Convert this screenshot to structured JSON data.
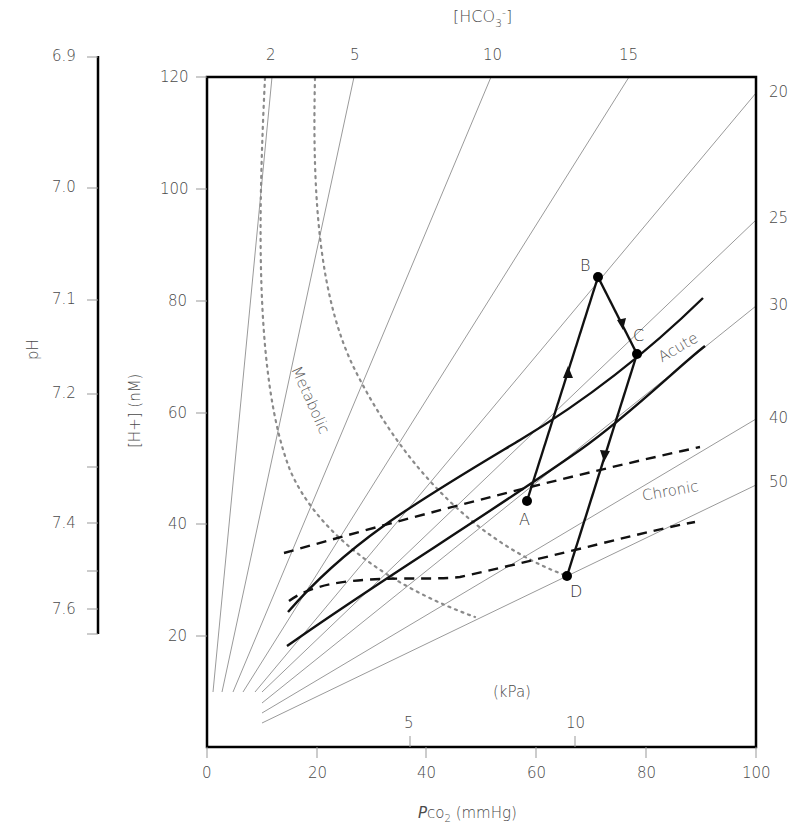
{
  "diagram": {
    "title": "",
    "top_axis": {
      "label": "[HCO3-]",
      "label_main": "[HCO",
      "label_sub": "3",
      "label_sup": "-",
      "label_close": "]",
      "ticks": [
        "2",
        "5",
        "10",
        "15"
      ]
    },
    "right_axis": {
      "ticks": [
        "20",
        "25",
        "30",
        "40",
        "50"
      ]
    },
    "left_ph_axis": {
      "label": "pH",
      "ticks": [
        "6.9",
        "7.0",
        "7.1",
        "7.2",
        "7.4",
        "7.6"
      ]
    },
    "y_axis": {
      "label": "[H+] (nM)",
      "ticks": [
        "120",
        "100",
        "80",
        "60",
        "40",
        "20"
      ]
    },
    "x_axis": {
      "label_italic": "P",
      "label_rest": "co",
      "label_sub": "2",
      "label_unit": " (mmHg)",
      "ticks": [
        "0",
        "20",
        "40",
        "60",
        "80",
        "100"
      ]
    },
    "kpa_axis": {
      "label": "(kPa)",
      "ticks": [
        "5",
        "10"
      ]
    },
    "region_labels": {
      "metabolic": "Metabolic",
      "acute": "Acute",
      "chronic": "Chronic"
    },
    "points": [
      {
        "id": "A",
        "label": "A",
        "pco2": 58,
        "h": 44
      },
      {
        "id": "B",
        "label": "B",
        "pco2": 71,
        "h": 84
      },
      {
        "id": "C",
        "label": "C",
        "pco2": 78,
        "h": 70
      },
      {
        "id": "D",
        "label": "D",
        "pco2": 65,
        "h": 31
      }
    ],
    "path_sequence": [
      "A",
      "B",
      "C",
      "D"
    ],
    "colors": {
      "frame": "#000000",
      "isopleth": "#9a9a9a",
      "metabolic_dotted": "#8a8a8a",
      "band": "#111111",
      "text": "#4a4a4a"
    }
  }
}
